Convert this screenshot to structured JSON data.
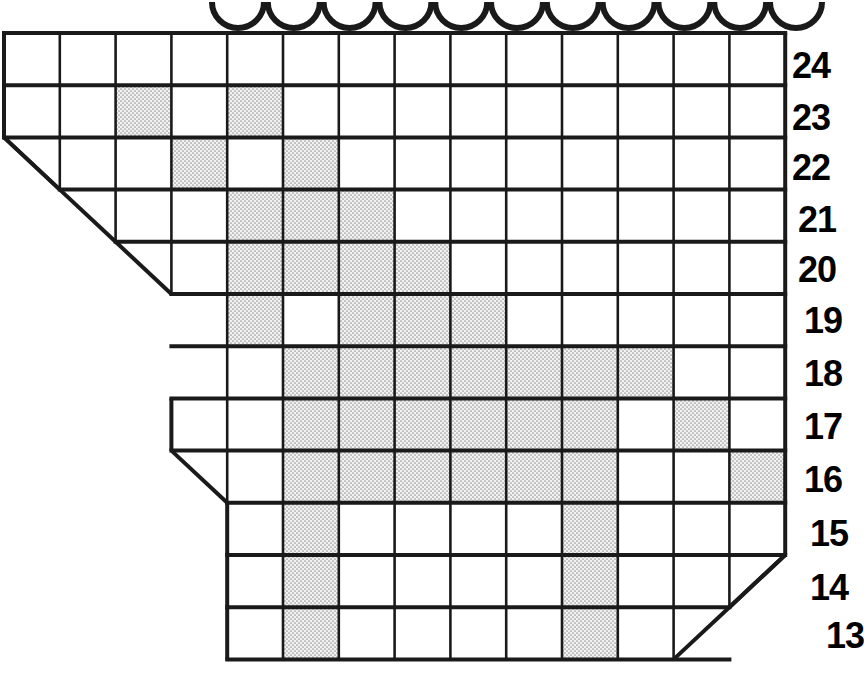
{
  "figure": {
    "kind": "grid-matrix-chart",
    "colors": {
      "grid_line": "#1a1a1a",
      "cell_empty": "#ffffff",
      "cell_filled": "#e4e4e4",
      "label_text": "#000000",
      "background": "#ffffff"
    },
    "geometry": {
      "origin_x": 4,
      "origin_y": 33,
      "cell_width": 55.8,
      "cell_height": 52.2,
      "columns": 14,
      "rows": 12,
      "stroke_width": 4
    }
  },
  "top_ornaments": {
    "name": "scallop-arc-row",
    "count": 11,
    "start_x": 238,
    "spacing": 55.8,
    "radius": 26,
    "baseline_y": 2
  },
  "row_labels": {
    "x": 792,
    "values": [
      "24",
      "23",
      "22",
      "21",
      "20",
      "19",
      "18",
      "17",
      "16",
      "15",
      "14",
      "13"
    ],
    "offsets_y": [
      48,
      100,
      150,
      202,
      252,
      303,
      356,
      409,
      462,
      516,
      570,
      618
    ],
    "indents_x": [
      0,
      0,
      0,
      6,
      6,
      12,
      12,
      12,
      12,
      18,
      18,
      34
    ]
  },
  "chart_data": {
    "type": "heatmap",
    "title": "",
    "xlabel": "",
    "ylabel": "",
    "legend": [],
    "columns": [
      1,
      2,
      3,
      4,
      5,
      6,
      7,
      8,
      9,
      10,
      11,
      12,
      13,
      14
    ],
    "row_order": [
      "24",
      "23",
      "22",
      "21",
      "20",
      "19",
      "18",
      "17",
      "16",
      "15",
      "14",
      "13"
    ],
    "rows": [
      {
        "label": "24",
        "first_col": 1,
        "last_col": 14,
        "left_cut": false,
        "right_cut": false,
        "filled": []
      },
      {
        "label": "23",
        "first_col": 1,
        "last_col": 14,
        "left_cut": false,
        "right_cut": false,
        "filled": [
          3,
          5
        ]
      },
      {
        "label": "22",
        "first_col": 1,
        "last_col": 14,
        "left_cut": true,
        "right_cut": false,
        "filled": [
          4,
          6
        ]
      },
      {
        "label": "21",
        "first_col": 2,
        "last_col": 14,
        "left_cut": true,
        "right_cut": false,
        "filled": [
          5,
          6,
          7
        ]
      },
      {
        "label": "20",
        "first_col": 3,
        "last_col": 14,
        "left_cut": true,
        "right_cut": false,
        "filled": [
          5,
          6,
          7,
          8
        ]
      },
      {
        "label": "19",
        "first_col": 4,
        "last_col": 14,
        "left_cut": true,
        "right_cut": false,
        "filled": [
          5,
          7,
          8,
          9
        ]
      },
      {
        "label": "18",
        "first_col": 4,
        "last_col": 14,
        "left_cut": true,
        "right_cut": false,
        "filled": [
          6,
          7,
          8,
          9,
          10,
          11,
          12
        ]
      },
      {
        "label": "17",
        "first_col": 4,
        "last_col": 14,
        "left_cut": false,
        "right_cut": false,
        "filled": [
          6,
          7,
          8,
          9,
          10,
          11,
          13
        ]
      },
      {
        "label": "16",
        "first_col": 4,
        "last_col": 14,
        "left_cut": true,
        "right_cut": false,
        "filled": [
          6,
          7,
          8,
          9,
          10,
          11,
          14
        ]
      },
      {
        "label": "15",
        "first_col": 5,
        "last_col": 14,
        "left_cut": false,
        "right_cut": false,
        "filled": [
          6,
          11
        ]
      },
      {
        "label": "14",
        "first_col": 5,
        "last_col": 14,
        "left_cut": false,
        "right_cut": true,
        "filled": [
          6,
          11
        ]
      },
      {
        "label": "13",
        "first_col": 5,
        "last_col": 13,
        "left_cut": false,
        "right_cut": true,
        "filled": [
          6,
          11
        ]
      }
    ],
    "left_boundary_steps": [
      {
        "from_row": "22",
        "col": 1
      },
      {
        "from_row": "21",
        "col": 2
      },
      {
        "from_row": "20",
        "col": 3
      },
      {
        "from_row": "19",
        "col": 4
      },
      {
        "from_row": "18",
        "col": 4
      },
      {
        "from_row": "16",
        "col": 5
      }
    ],
    "right_boundary_steps": [
      {
        "from_row": "14",
        "col": 14
      },
      {
        "from_row": "13",
        "col": 13
      }
    ],
    "totals": {
      "filled_cells": 46,
      "grid_rows": 12,
      "grid_columns": 14
    }
  }
}
